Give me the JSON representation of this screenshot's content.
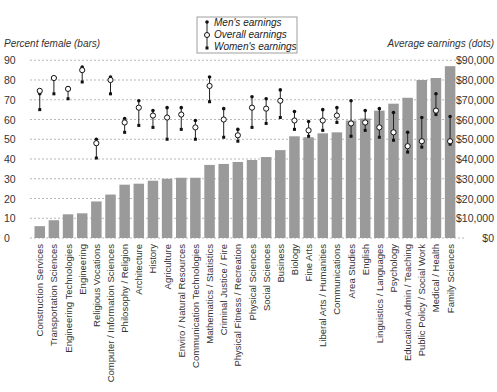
{
  "chart_data": {
    "type": "bar",
    "subtype": "bar + range-dot overlay (dual axis)",
    "left_axis": {
      "title": "Percent female (bars)",
      "ticks": [
        0,
        10,
        20,
        30,
        40,
        50,
        60,
        70,
        80,
        90
      ],
      "ylim": [
        0,
        90
      ]
    },
    "right_axis": {
      "title": "Average earnings (dots)",
      "ticks": [
        "$0",
        "$10,000",
        "$20,000",
        "$30,000",
        "$40,000",
        "$50,000",
        "$60,000",
        "$70,000",
        "$80,000",
        "$90,000"
      ],
      "ylim": [
        0,
        90000
      ]
    },
    "grid": true,
    "legend": {
      "position": "top-center",
      "entries": [
        "Men's earnings",
        "Overall earnings",
        "Women's earnings"
      ]
    },
    "categories": [
      "Construction Services",
      "Transportation Sciences",
      "Engineering Technologies",
      "Engineering",
      "Religious Vocations",
      "Computer / Information Sciences",
      "Philosophy / Religion",
      "Architecture",
      "History",
      "Agriculture",
      "Enviro / Natural Resources",
      "Communication Technologies",
      "Mathematics / Statistics",
      "Criminal Justice / Fire",
      "Physical Fitness / Recreation",
      "Physical Sciences",
      "Social Sciences",
      "Business",
      "Biology",
      "Fine Arts",
      "Liberal Arts / Humanities",
      "Communications",
      "Area Studies",
      "English",
      "Linguistics / Languages",
      "Psychology",
      "Education Admin / Teaching",
      "Public Policy / Social Work",
      "Medical / Health",
      "Family Sciences"
    ],
    "series": [
      {
        "name": "Percent female",
        "axis": "left",
        "kind": "bar",
        "color": "#9a9a9a",
        "values": [
          6,
          9,
          12,
          12.5,
          18.5,
          22,
          27,
          27.5,
          29,
          30,
          30.5,
          30.5,
          37,
          37.5,
          38.5,
          39.5,
          41,
          44.5,
          51.5,
          51,
          53,
          53.5,
          59.5,
          60.5,
          64.5,
          68,
          71,
          80,
          81,
          87
        ]
      },
      {
        "name": "Men's earnings",
        "axis": "right",
        "kind": "dot",
        "values": [
          73000,
          81000,
          76000,
          86500,
          50000,
          81500,
          60500,
          69500,
          64500,
          66000,
          66000,
          59500,
          81500,
          65500,
          55000,
          71500,
          70500,
          75000,
          64000,
          59000,
          65000,
          66000,
          69500,
          64500,
          65500,
          63500,
          53500,
          61000,
          73000,
          61500
        ]
      },
      {
        "name": "Overall earnings",
        "axis": "right",
        "kind": "open-dot",
        "values": [
          74500,
          81000,
          75500,
          85000,
          48000,
          80000,
          58500,
          66000,
          62000,
          61000,
          62500,
          56000,
          77000,
          60000,
          52000,
          66000,
          65500,
          69500,
          59500,
          54500,
          59500,
          62000,
          58000,
          58500,
          56000,
          53500,
          46500,
          49000,
          64500,
          49000
        ]
      },
      {
        "name": "Women's earnings",
        "axis": "right",
        "kind": "dot",
        "values": [
          65000,
          73000,
          70500,
          79000,
          40500,
          73000,
          53500,
          57000,
          56000,
          50000,
          55000,
          50000,
          69000,
          51000,
          49000,
          56000,
          58000,
          61000,
          55000,
          51500,
          54500,
          58500,
          51500,
          54500,
          51000,
          49500,
          43500,
          46000,
          62500,
          47500
        ]
      }
    ]
  }
}
